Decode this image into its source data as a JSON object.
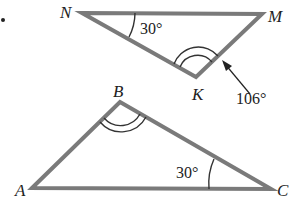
{
  "diagram": {
    "problem_marker": "•",
    "triangles": [
      {
        "name": "NMK",
        "vertices": {
          "N": [
            82,
            13
          ],
          "M": [
            262,
            14
          ],
          "K": [
            196,
            77
          ]
        },
        "labels": {
          "N": "N",
          "M": "M",
          "K": "K"
        },
        "angles": [
          {
            "vertex": "N",
            "value": "30°",
            "marks": 1
          },
          {
            "vertex": "K",
            "value": "106°",
            "marks": 2,
            "callout_arrow": true
          }
        ]
      },
      {
        "name": "ABC",
        "vertices": {
          "A": [
            32,
            188
          ],
          "B": [
            120,
            102
          ],
          "C": [
            271,
            189
          ]
        },
        "labels": {
          "A": "A",
          "B": "B",
          "C": "C"
        },
        "angles": [
          {
            "vertex": "B",
            "marks": 2
          },
          {
            "vertex": "C",
            "value": "30°",
            "marks": 1
          }
        ]
      }
    ],
    "colors": {
      "edge": "#7a7a7a",
      "text": "#222222"
    }
  }
}
